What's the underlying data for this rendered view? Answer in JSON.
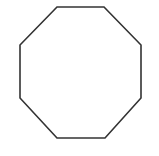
{
  "canvas": {
    "width": 159,
    "height": 156,
    "background_color": "#ffffff"
  },
  "figure": {
    "name": "octagon",
    "label": "Octagon",
    "sides": 8,
    "fill": "none",
    "stroke_color": "#333333",
    "stroke_width": 1.6,
    "stroke_linejoin": "miter",
    "points": "57,7 104,7 141,45 141,98 105,138 57,138 20,98 20,45",
    "vertices": [
      {
        "index": 1,
        "x": 57,
        "y": 7
      },
      {
        "index": 2,
        "x": 104,
        "y": 7
      },
      {
        "index": 3,
        "x": 141,
        "y": 45
      },
      {
        "index": 4,
        "x": 141,
        "y": 98
      },
      {
        "index": 5,
        "x": 105,
        "y": 138
      },
      {
        "index": 6,
        "x": 57,
        "y": 138
      },
      {
        "index": 7,
        "x": 20,
        "y": 98
      },
      {
        "index": 8,
        "x": 20,
        "y": 45
      }
    ]
  }
}
